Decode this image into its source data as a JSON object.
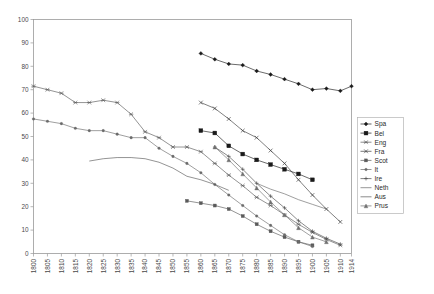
{
  "chart_data": {
    "type": "line",
    "title": "",
    "xlabel": "",
    "ylabel": "",
    "xlim": [
      1800,
      1914
    ],
    "ylim": [
      0,
      100
    ],
    "yticks": [
      0,
      10,
      20,
      30,
      40,
      50,
      60,
      70,
      80,
      90,
      100
    ],
    "xticks": [
      1800,
      1805,
      1810,
      1815,
      1820,
      1825,
      1830,
      1835,
      1840,
      1845,
      1850,
      1855,
      1860,
      1865,
      1870,
      1875,
      1880,
      1885,
      1890,
      1895,
      1900,
      1905,
      1910,
      1914
    ],
    "grid": false,
    "legend_position": "right",
    "series": [
      {
        "name": "Spa",
        "marker": "diamond",
        "color": "#1a1a1a",
        "points": [
          [
            1860,
            85.5
          ],
          [
            1865,
            83.0
          ],
          [
            1870,
            81.0
          ],
          [
            1875,
            80.5
          ],
          [
            1880,
            78.0
          ],
          [
            1885,
            76.5
          ],
          [
            1890,
            74.5
          ],
          [
            1895,
            72.5
          ],
          [
            1900,
            70.0
          ],
          [
            1905,
            70.5
          ],
          [
            1910,
            69.5
          ],
          [
            1914,
            71.5
          ]
        ]
      },
      {
        "name": "Bel",
        "marker": "square",
        "color": "#1a1a1a",
        "points": [
          [
            1860,
            52.5
          ],
          [
            1865,
            51.5
          ],
          [
            1870,
            46.0
          ],
          [
            1875,
            42.5
          ],
          [
            1880,
            40.0
          ],
          [
            1885,
            38.0
          ],
          [
            1890,
            36.0
          ],
          [
            1895,
            34.0
          ],
          [
            1900,
            31.5
          ]
        ]
      },
      {
        "name": "Eng",
        "marker": "star",
        "color": "#5a5a5a",
        "points": [
          [
            1800,
            71.5
          ],
          [
            1805,
            70.0
          ],
          [
            1810,
            68.5
          ],
          [
            1815,
            64.5
          ],
          [
            1820,
            64.5
          ],
          [
            1825,
            65.5
          ],
          [
            1830,
            64.5
          ],
          [
            1835,
            59.5
          ],
          [
            1840,
            52.0
          ],
          [
            1845,
            49.5
          ],
          [
            1850,
            45.5
          ],
          [
            1855,
            45.5
          ],
          [
            1860,
            43.5
          ],
          [
            1865,
            38.5
          ],
          [
            1870,
            33.5
          ],
          [
            1875,
            29.0
          ],
          [
            1880,
            24.0
          ],
          [
            1885,
            20.5
          ],
          [
            1890,
            16.5
          ],
          [
            1895,
            12.5
          ],
          [
            1900,
            9.0
          ],
          [
            1905,
            6.0
          ],
          [
            1910,
            3.5
          ]
        ]
      },
      {
        "name": "Fra",
        "marker": "cross",
        "color": "#3d3d3d",
        "points": [
          [
            1860,
            64.5
          ],
          [
            1865,
            62.0
          ],
          [
            1870,
            57.5
          ],
          [
            1875,
            52.5
          ],
          [
            1880,
            49.5
          ],
          [
            1885,
            44.0
          ],
          [
            1890,
            38.5
          ],
          [
            1895,
            31.5
          ],
          [
            1900,
            25.0
          ],
          [
            1905,
            19.0
          ],
          [
            1910,
            13.5
          ]
        ]
      },
      {
        "name": "Scot",
        "marker": "square-sm",
        "color": "#5a5a5a",
        "points": [
          [
            1855,
            22.5
          ],
          [
            1860,
            21.5
          ],
          [
            1865,
            20.5
          ],
          [
            1870,
            19.0
          ],
          [
            1875,
            16.0
          ],
          [
            1880,
            12.5
          ],
          [
            1885,
            9.5
          ],
          [
            1890,
            7.0
          ],
          [
            1895,
            5.0
          ],
          [
            1900,
            3.5
          ]
        ]
      },
      {
        "name": "It",
        "marker": "dot",
        "color": "#6a6a6a",
        "points": [
          [
            1800,
            57.5
          ],
          [
            1805,
            56.5
          ],
          [
            1810,
            55.5
          ],
          [
            1815,
            53.5
          ],
          [
            1820,
            52.5
          ],
          [
            1825,
            52.5
          ],
          [
            1830,
            51.0
          ],
          [
            1835,
            49.5
          ],
          [
            1840,
            49.5
          ],
          [
            1845,
            45.0
          ],
          [
            1850,
            41.5
          ],
          [
            1855,
            38.5
          ],
          [
            1860,
            34.5
          ],
          [
            1865,
            29.5
          ],
          [
            1870,
            25.0
          ],
          [
            1875,
            20.5
          ],
          [
            1880,
            16.0
          ],
          [
            1885,
            12.0
          ],
          [
            1890,
            8.0
          ],
          [
            1895,
            5.0
          ],
          [
            1900,
            3.0
          ]
        ]
      },
      {
        "name": "Ire",
        "marker": "plus",
        "color": "#4a4a4a",
        "points": [
          [
            1865,
            45.5
          ],
          [
            1870,
            41.5
          ],
          [
            1875,
            36.0
          ],
          [
            1880,
            30.0
          ],
          [
            1885,
            24.5
          ],
          [
            1890,
            19.5
          ],
          [
            1895,
            14.0
          ],
          [
            1900,
            9.5
          ],
          [
            1905,
            6.5
          ],
          [
            1910,
            4.0
          ]
        ]
      },
      {
        "name": "Neth",
        "marker": "none",
        "color": "#6a6a6a",
        "points": [
          [
            1880,
            30.0
          ],
          [
            1885,
            27.5
          ],
          [
            1890,
            25.5
          ],
          [
            1895,
            23.0
          ],
          [
            1900,
            21.0
          ],
          [
            1905,
            19.0
          ]
        ]
      },
      {
        "name": "Aus",
        "marker": "none",
        "color": "#5a5a5a",
        "points": [
          [
            1820,
            39.5
          ],
          [
            1825,
            40.5
          ],
          [
            1830,
            41.0
          ],
          [
            1835,
            41.0
          ],
          [
            1840,
            40.5
          ],
          [
            1845,
            39.0
          ],
          [
            1850,
            36.5
          ],
          [
            1855,
            33.0
          ],
          [
            1860,
            31.5
          ],
          [
            1865,
            29.5
          ],
          [
            1870,
            27.0
          ]
        ]
      },
      {
        "name": "Prus",
        "marker": "tri",
        "color": "#707070",
        "points": [
          [
            1865,
            45.5
          ],
          [
            1870,
            40.0
          ],
          [
            1875,
            34.0
          ],
          [
            1880,
            28.0
          ],
          [
            1885,
            22.0
          ],
          [
            1890,
            16.5
          ],
          [
            1895,
            11.0
          ],
          [
            1900,
            7.0
          ],
          [
            1905,
            5.0
          ]
        ]
      }
    ]
  },
  "legend": {
    "items": [
      {
        "label": "Spa"
      },
      {
        "label": "Bel"
      },
      {
        "label": "Eng"
      },
      {
        "label": "Fra"
      },
      {
        "label": "Scot"
      },
      {
        "label": "It"
      },
      {
        "label": "Ire"
      },
      {
        "label": "Neth"
      },
      {
        "label": "Aus"
      },
      {
        "label": "Prus"
      }
    ]
  }
}
